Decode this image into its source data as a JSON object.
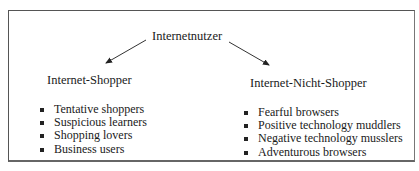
{
  "diagram": {
    "root": {
      "label": "Internetnutzer"
    },
    "branches": [
      {
        "label": "Internet-Shopper",
        "items": [
          "Tentative shoppers",
          "Suspicious learners",
          "Shopping lovers",
          "Business users"
        ]
      },
      {
        "label": "Internet-Nicht-Shopper",
        "items": [
          "Fearful browsers",
          "Positive technology muddlers",
          "Negative technology musslers",
          "Adventurous browsers"
        ]
      }
    ],
    "edges": [
      {
        "from": "Internetnutzer",
        "to": "Internet-Shopper"
      },
      {
        "from": "Internetnutzer",
        "to": "Internet-Nicht-Shopper"
      }
    ]
  }
}
